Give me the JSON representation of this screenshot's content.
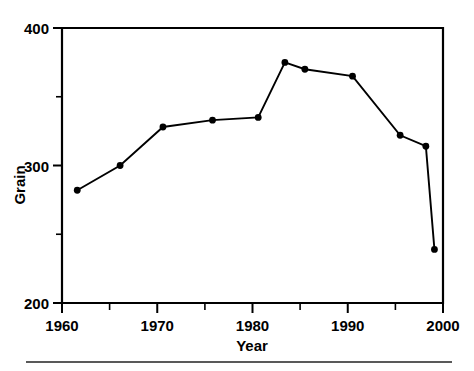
{
  "chart_data": {
    "type": "line",
    "title": "",
    "xlabel": "Year",
    "ylabel": "Grain",
    "xlim": [
      1960,
      2000
    ],
    "ylim": [
      200,
      400
    ],
    "grid": false,
    "legend": null,
    "x_ticks": [
      1960,
      1970,
      1980,
      1990,
      2000
    ],
    "x_tick_labels": [
      "1960",
      "1970",
      "1980",
      "1990",
      "2000"
    ],
    "x_minor_ticks": [
      1965,
      1975,
      1985,
      1995
    ],
    "y_ticks": [
      200,
      300,
      400
    ],
    "y_tick_labels": [
      "200",
      "300",
      "400"
    ],
    "y_minor_ticks": [
      250,
      350
    ],
    "marker": "filled-circle",
    "line_color": "#000000",
    "marker_color": "#000000",
    "x": [
      1961.6,
      1966.1,
      1970.6,
      1975.8,
      1980.6,
      1983.4,
      1985.5,
      1990.5,
      1995.5,
      1998.2,
      1999.1
    ],
    "y": [
      282,
      300,
      328,
      333,
      335,
      375,
      370,
      365,
      322,
      314,
      239
    ],
    "points": [
      {
        "year": 1961.6,
        "value": 282
      },
      {
        "year": 1966.1,
        "value": 300
      },
      {
        "year": 1970.6,
        "value": 328
      },
      {
        "year": 1975.8,
        "value": 333
      },
      {
        "year": 1980.6,
        "value": 335
      },
      {
        "year": 1983.4,
        "value": 375
      },
      {
        "year": 1985.5,
        "value": 370
      },
      {
        "year": 1990.5,
        "value": 365
      },
      {
        "year": 1995.5,
        "value": 322
      },
      {
        "year": 1998.2,
        "value": 314
      },
      {
        "year": 1999.1,
        "value": 239
      }
    ]
  },
  "axes": {
    "x_axis_title": "Year",
    "y_axis_title": "Grain",
    "x_tick_labels": [
      "1960",
      "1970",
      "1980",
      "1990",
      "2000"
    ],
    "y_tick_labels": [
      "400",
      "300",
      "200"
    ]
  }
}
